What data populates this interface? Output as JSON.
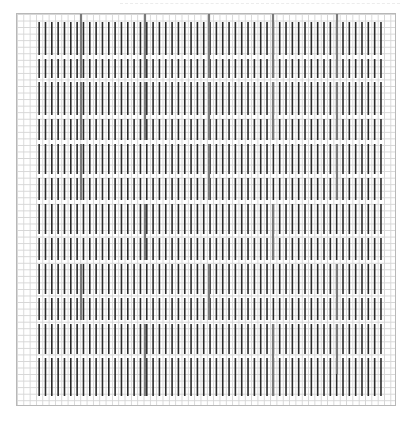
{
  "chart": {
    "kind": "knitting-stitch-chart",
    "frame": {
      "x": 16,
      "y": 13,
      "width": 380,
      "height": 393
    },
    "grid": {
      "cell_width": 6.33,
      "cell_height": 6.55,
      "columns": 60,
      "rows": 60,
      "grid_color": "#d6d6d6",
      "border_color": "#b8b8b8"
    },
    "stitch_bars": {
      "color": "#2a2a2a",
      "width": 1.6,
      "first_column": 3,
      "last_column": 57,
      "bands": [
        {
          "y0": 8,
          "y1": 41
        },
        {
          "y0": 45,
          "y1": 64
        },
        {
          "y0": 68,
          "y1": 101
        },
        {
          "y0": 105,
          "y1": 126
        },
        {
          "y0": 130,
          "y1": 160
        },
        {
          "y0": 164,
          "y1": 186
        },
        {
          "y0": 190,
          "y1": 220
        },
        {
          "y0": 224,
          "y1": 246
        },
        {
          "y0": 250,
          "y1": 280
        },
        {
          "y0": 284,
          "y1": 306
        },
        {
          "y0": 310,
          "y1": 340
        },
        {
          "y0": 344,
          "y1": 382
        }
      ],
      "gap_color": "#ffffff"
    },
    "major_lines": {
      "color": "#7a7a7a",
      "width": 2.2,
      "segments": [
        {
          "x": 64,
          "y0": 0,
          "y1": 64
        },
        {
          "x": 128,
          "y0": 0,
          "y1": 64
        },
        {
          "x": 192,
          "y0": 0,
          "y1": 64
        },
        {
          "x": 256,
          "y0": 0,
          "y1": 64
        },
        {
          "x": 320,
          "y0": 0,
          "y1": 64
        },
        {
          "x": 64,
          "y0": 68,
          "y1": 126
        },
        {
          "x": 128,
          "y0": 68,
          "y1": 126
        },
        {
          "x": 192,
          "y0": 68,
          "y1": 126
        },
        {
          "x": 256,
          "y0": 68,
          "y1": 126
        },
        {
          "x": 320,
          "y0": 68,
          "y1": 126
        },
        {
          "x": 64,
          "y0": 130,
          "y1": 186
        },
        {
          "x": 192,
          "y0": 130,
          "y1": 186
        },
        {
          "x": 320,
          "y0": 130,
          "y1": 186
        },
        {
          "x": 128,
          "y0": 190,
          "y1": 246
        },
        {
          "x": 256,
          "y0": 190,
          "y1": 246
        },
        {
          "x": 64,
          "y0": 250,
          "y1": 306
        },
        {
          "x": 192,
          "y0": 250,
          "y1": 306
        },
        {
          "x": 320,
          "y0": 250,
          "y1": 306
        },
        {
          "x": 128,
          "y0": 310,
          "y1": 382
        },
        {
          "x": 256,
          "y0": 310,
          "y1": 382
        },
        {
          "x": 320,
          "y0": 310,
          "y1": 360
        }
      ]
    },
    "top_dash": {
      "x0": 120,
      "x1": 400,
      "y": 3,
      "color": "#ececec"
    }
  }
}
